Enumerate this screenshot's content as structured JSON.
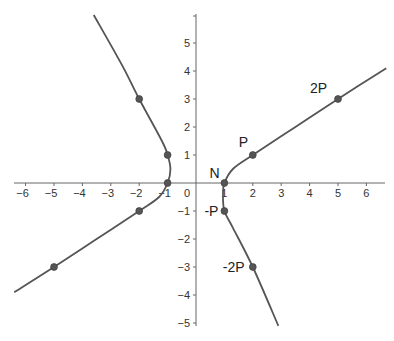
{
  "chart_data": {
    "type": "line",
    "title": "",
    "xlabel": "",
    "ylabel": "",
    "xlim": [
      -6.8,
      6.8
    ],
    "ylim": [
      -5,
      5.8
    ],
    "grid": false,
    "x_ticks": [
      -6,
      -5,
      -4,
      -3,
      -2,
      -1,
      1,
      2,
      3,
      4,
      5,
      6
    ],
    "y_ticks": [
      -5,
      -4,
      -3,
      -2,
      -1,
      1,
      2,
      3,
      4,
      5
    ],
    "origin_label": "0",
    "curve_color": "#555555",
    "point_color": "#555555",
    "series": [
      {
        "name": "right branch",
        "points": [
          [
            2.9,
            -5.1
          ],
          [
            2,
            -3
          ],
          [
            1.3,
            -1.6
          ],
          [
            1,
            -1
          ],
          [
            0.95,
            -0.4
          ],
          [
            1,
            0
          ],
          [
            1.3,
            0.5
          ],
          [
            2,
            1
          ],
          [
            3.5,
            2
          ],
          [
            5,
            3
          ],
          [
            6.7,
            4.1
          ]
        ]
      },
      {
        "name": "left branch",
        "points": [
          [
            -3.6,
            6
          ],
          [
            -2.6,
            4.2
          ],
          [
            -2,
            3
          ],
          [
            -1.2,
            1.5
          ],
          [
            -1,
            1
          ],
          [
            -0.9,
            0.5
          ],
          [
            -1,
            0
          ],
          [
            -1.3,
            -0.5
          ],
          [
            -2,
            -1
          ],
          [
            -3.5,
            -2
          ],
          [
            -5,
            -3
          ],
          [
            -6.4,
            -3.9
          ]
        ]
      }
    ],
    "marked_points": [
      {
        "label": "N",
        "x": 1,
        "y": 0
      },
      {
        "label": "P",
        "x": 2,
        "y": 1
      },
      {
        "label": "2P",
        "x": 5,
        "y": 3
      },
      {
        "label": "-P",
        "x": 1,
        "y": -1
      },
      {
        "label": "-2P",
        "x": 2,
        "y": -3
      },
      {
        "label": "",
        "x": -1,
        "y": 0
      },
      {
        "label": "",
        "x": -1,
        "y": 1
      },
      {
        "label": "",
        "x": -2,
        "y": 3
      },
      {
        "label": "",
        "x": -2,
        "y": -1
      },
      {
        "label": "",
        "x": -5,
        "y": -3
      }
    ]
  }
}
